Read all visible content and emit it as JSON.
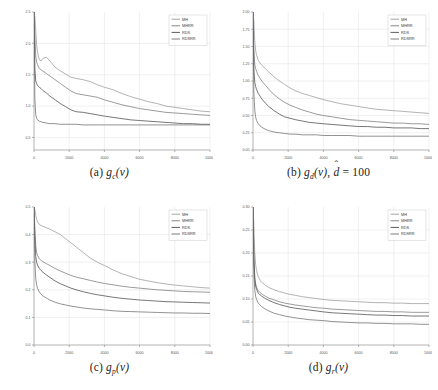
{
  "figure": {
    "panel_count": 4,
    "legend_entries": [
      "MH",
      "MHRR",
      "RDS",
      "RDSRR"
    ],
    "line_colors": [
      "#9a9a9a",
      "#7a7a7a",
      "#4a4a4a",
      "#6e6e6e"
    ],
    "axis_color": "#808080",
    "grid_color": "#d8d8d8",
    "background": "#ffffff"
  },
  "panels": {
    "a": {
      "caption_label": "(a)",
      "caption_func": "g",
      "caption_sub": "c",
      "caption_arg": "(v)",
      "caption_full": "(a) g_c(v)",
      "legend": [
        "MH",
        "MHRR",
        "RDS",
        "RDSRR"
      ],
      "x_ticks": [
        "0",
        "2000",
        "4000",
        "6000",
        "8000",
        "10000"
      ],
      "y_ticks": [
        "0.5",
        "1.0",
        "1.5",
        "2.0",
        "2.5"
      ]
    },
    "b": {
      "caption_label": "(b)",
      "caption_func": "g",
      "caption_sub": "d",
      "caption_arg": "(v),",
      "caption_hat_var": "d",
      "caption_eq": "= 100",
      "caption_full": "(b) g_d(v), d̂ = 100",
      "legend": [
        "MH",
        "MHRR",
        "RDS",
        "RDSRR"
      ],
      "x_ticks": [
        "0",
        "2000",
        "4000",
        "6000",
        "8000",
        "10000"
      ],
      "y_ticks": [
        "0.00",
        "0.25",
        "0.50",
        "0.75",
        "1.00",
        "1.25",
        "1.50",
        "1.75",
        "2.00"
      ]
    },
    "c": {
      "caption_label": "(c)",
      "caption_func": "g",
      "caption_sub": "p",
      "caption_arg": "(v)",
      "caption_full": "(c) g_p(v)",
      "legend": [
        "MH",
        "MHRR",
        "RDS",
        "RDSRR"
      ],
      "x_ticks": [
        "0",
        "2000",
        "4000",
        "6000",
        "8000",
        "10000"
      ],
      "y_ticks": [
        "0.0",
        "0.1",
        "0.2",
        "0.3",
        "0.4",
        "0.5"
      ]
    },
    "d": {
      "caption_label": "(d)",
      "caption_func": "g",
      "caption_sub": "r",
      "caption_arg": "(v)",
      "caption_full": "(d) g_r(v)",
      "legend": [
        "MH",
        "MHRR",
        "RDS",
        "RDSRR"
      ],
      "x_ticks": [
        "0",
        "2000",
        "4000",
        "6000",
        "8000",
        "10000"
      ],
      "y_ticks": [
        "0.00",
        "0.05",
        "0.10",
        "0.15",
        "0.20",
        "0.25",
        "0.30"
      ]
    }
  },
  "chart_data": [
    {
      "type": "line",
      "panel": "a",
      "title": "(a) g_c(v)",
      "xlabel": "",
      "ylabel": "",
      "xlim": [
        0,
        10000
      ],
      "ylim": [
        0.3,
        2.5
      ],
      "grid": true,
      "legend_position": "top-right",
      "x": [
        0,
        50,
        100,
        150,
        200,
        300,
        400,
        500,
        700,
        900,
        1200,
        1500,
        1800,
        2100,
        2400,
        2800,
        3200,
        3600,
        4000,
        4500,
        5000,
        5500,
        6000,
        6500,
        7000,
        7500,
        8000,
        8500,
        9000,
        9500,
        10000
      ],
      "series": [
        {
          "name": "MH",
          "color": "#9a9a9a",
          "values": [
            2.5,
            2.42,
            2.2,
            1.98,
            1.86,
            1.74,
            1.72,
            1.76,
            1.78,
            1.72,
            1.62,
            1.56,
            1.51,
            1.46,
            1.44,
            1.42,
            1.39,
            1.34,
            1.3,
            1.26,
            1.2,
            1.15,
            1.11,
            1.07,
            1.04,
            1.0,
            0.98,
            0.96,
            0.94,
            0.92,
            0.91
          ]
        },
        {
          "name": "MHRR",
          "color": "#7a7a7a",
          "values": [
            2.5,
            2.12,
            1.8,
            1.7,
            1.66,
            1.6,
            1.58,
            1.56,
            1.52,
            1.48,
            1.42,
            1.36,
            1.3,
            1.24,
            1.2,
            1.18,
            1.16,
            1.14,
            1.1,
            1.06,
            1.02,
            0.99,
            0.96,
            0.94,
            0.92,
            0.9,
            0.89,
            0.88,
            0.87,
            0.86,
            0.85
          ]
        },
        {
          "name": "RDS",
          "color": "#4a4a4a",
          "values": [
            2.5,
            1.58,
            1.4,
            1.36,
            1.33,
            1.3,
            1.28,
            1.25,
            1.21,
            1.16,
            1.1,
            1.04,
            0.99,
            0.94,
            0.91,
            0.9,
            0.88,
            0.86,
            0.84,
            0.82,
            0.8,
            0.78,
            0.77,
            0.76,
            0.75,
            0.74,
            0.73,
            0.72,
            0.72,
            0.71,
            0.71
          ]
        },
        {
          "name": "RDSRR",
          "color": "#6e6e6e",
          "values": [
            2.5,
            1.1,
            0.86,
            0.8,
            0.78,
            0.76,
            0.75,
            0.74,
            0.73,
            0.72,
            0.72,
            0.71,
            0.71,
            0.71,
            0.71,
            0.7,
            0.7,
            0.7,
            0.7,
            0.7,
            0.7,
            0.7,
            0.7,
            0.7,
            0.7,
            0.7,
            0.7,
            0.7,
            0.7,
            0.7,
            0.7
          ]
        }
      ]
    },
    {
      "type": "line",
      "panel": "b",
      "title": "(b) g_d(v), d-hat = 100",
      "xlabel": "",
      "ylabel": "",
      "xlim": [
        0,
        10000
      ],
      "ylim": [
        0.0,
        2.0
      ],
      "grid": true,
      "legend_position": "top-right",
      "x": [
        0,
        50,
        100,
        150,
        200,
        300,
        400,
        500,
        700,
        900,
        1200,
        1500,
        1800,
        2100,
        2400,
        2800,
        3200,
        3600,
        4000,
        4500,
        5000,
        5500,
        6000,
        6500,
        7000,
        7500,
        8000,
        8500,
        9000,
        9500,
        10000
      ],
      "series": [
        {
          "name": "MH",
          "color": "#9a9a9a",
          "values": [
            2.0,
            1.86,
            1.58,
            1.44,
            1.38,
            1.3,
            1.26,
            1.23,
            1.18,
            1.13,
            1.06,
            1.0,
            0.95,
            0.9,
            0.86,
            0.82,
            0.79,
            0.76,
            0.73,
            0.7,
            0.67,
            0.65,
            0.63,
            0.61,
            0.59,
            0.58,
            0.57,
            0.56,
            0.55,
            0.54,
            0.53
          ]
        },
        {
          "name": "MHRR",
          "color": "#7a7a7a",
          "values": [
            2.0,
            1.46,
            1.24,
            1.18,
            1.14,
            1.08,
            1.04,
            1.0,
            0.94,
            0.88,
            0.8,
            0.74,
            0.69,
            0.65,
            0.62,
            0.58,
            0.55,
            0.52,
            0.5,
            0.48,
            0.46,
            0.44,
            0.43,
            0.42,
            0.41,
            0.4,
            0.39,
            0.39,
            0.38,
            0.38,
            0.37
          ]
        },
        {
          "name": "RDS",
          "color": "#4a4a4a",
          "values": [
            2.0,
            1.16,
            0.98,
            0.92,
            0.88,
            0.82,
            0.78,
            0.74,
            0.68,
            0.63,
            0.57,
            0.52,
            0.48,
            0.46,
            0.44,
            0.42,
            0.4,
            0.39,
            0.38,
            0.37,
            0.36,
            0.35,
            0.34,
            0.34,
            0.33,
            0.33,
            0.32,
            0.32,
            0.32,
            0.31,
            0.31
          ]
        },
        {
          "name": "RDSRR",
          "color": "#6e6e6e",
          "values": [
            2.0,
            0.82,
            0.58,
            0.48,
            0.43,
            0.38,
            0.35,
            0.33,
            0.3,
            0.28,
            0.26,
            0.25,
            0.24,
            0.23,
            0.23,
            0.22,
            0.22,
            0.22,
            0.21,
            0.21,
            0.21,
            0.21,
            0.2,
            0.2,
            0.2,
            0.2,
            0.2,
            0.2,
            0.2,
            0.2,
            0.2
          ]
        }
      ]
    },
    {
      "type": "line",
      "panel": "c",
      "title": "(c) g_p(v)",
      "xlabel": "",
      "ylabel": "",
      "xlim": [
        0,
        10000
      ],
      "ylim": [
        0.0,
        0.5
      ],
      "grid": true,
      "legend_position": "top-right",
      "x": [
        0,
        50,
        100,
        150,
        200,
        300,
        400,
        500,
        700,
        900,
        1200,
        1500,
        1800,
        2100,
        2400,
        2800,
        3200,
        3600,
        4000,
        4500,
        5000,
        5500,
        6000,
        6500,
        7000,
        7500,
        8000,
        8500,
        9000,
        9500,
        10000
      ],
      "series": [
        {
          "name": "MH",
          "color": "#9a9a9a",
          "values": [
            0.5,
            0.49,
            0.47,
            0.455,
            0.446,
            0.437,
            0.433,
            0.43,
            0.425,
            0.42,
            0.41,
            0.4,
            0.385,
            0.37,
            0.355,
            0.335,
            0.315,
            0.3,
            0.288,
            0.272,
            0.258,
            0.248,
            0.238,
            0.232,
            0.226,
            0.221,
            0.217,
            0.214,
            0.211,
            0.208,
            0.206
          ]
        },
        {
          "name": "MHRR",
          "color": "#7a7a7a",
          "values": [
            0.5,
            0.42,
            0.36,
            0.335,
            0.325,
            0.313,
            0.307,
            0.302,
            0.295,
            0.288,
            0.277,
            0.268,
            0.26,
            0.252,
            0.246,
            0.24,
            0.234,
            0.228,
            0.223,
            0.218,
            0.213,
            0.209,
            0.206,
            0.203,
            0.2,
            0.198,
            0.196,
            0.194,
            0.193,
            0.192,
            0.191
          ]
        },
        {
          "name": "RDS",
          "color": "#4a4a4a",
          "values": [
            0.5,
            0.38,
            0.32,
            0.3,
            0.29,
            0.278,
            0.27,
            0.264,
            0.254,
            0.245,
            0.232,
            0.222,
            0.214,
            0.206,
            0.2,
            0.193,
            0.187,
            0.182,
            0.178,
            0.173,
            0.169,
            0.166,
            0.163,
            0.161,
            0.159,
            0.157,
            0.156,
            0.155,
            0.154,
            0.153,
            0.152
          ]
        },
        {
          "name": "RDSRR",
          "color": "#6e6e6e",
          "values": [
            0.5,
            0.3,
            0.24,
            0.218,
            0.206,
            0.192,
            0.184,
            0.178,
            0.17,
            0.163,
            0.155,
            0.149,
            0.145,
            0.141,
            0.138,
            0.134,
            0.131,
            0.129,
            0.127,
            0.124,
            0.122,
            0.121,
            0.12,
            0.119,
            0.118,
            0.117,
            0.116,
            0.116,
            0.115,
            0.115,
            0.114
          ]
        }
      ]
    },
    {
      "type": "line",
      "panel": "d",
      "title": "(d) g_r(v)",
      "xlabel": "",
      "ylabel": "",
      "xlim": [
        0,
        10000
      ],
      "ylim": [
        0.0,
        0.3
      ],
      "grid": true,
      "legend_position": "top-right",
      "x": [
        0,
        50,
        100,
        150,
        200,
        300,
        400,
        500,
        700,
        900,
        1200,
        1500,
        1800,
        2100,
        2400,
        2800,
        3200,
        3600,
        4000,
        4500,
        5000,
        5500,
        6000,
        6500,
        7000,
        7500,
        8000,
        8500,
        9000,
        9500,
        10000
      ],
      "series": [
        {
          "name": "MH",
          "color": "#9a9a9a",
          "values": [
            0.3,
            0.26,
            0.2,
            0.175,
            0.162,
            0.148,
            0.141,
            0.136,
            0.13,
            0.125,
            0.12,
            0.116,
            0.113,
            0.11,
            0.108,
            0.105,
            0.103,
            0.101,
            0.099,
            0.097,
            0.096,
            0.095,
            0.094,
            0.093,
            0.092,
            0.092,
            0.091,
            0.091,
            0.09,
            0.09,
            0.09
          ]
        },
        {
          "name": "MHRR",
          "color": "#7a7a7a",
          "values": [
            0.3,
            0.19,
            0.148,
            0.133,
            0.126,
            0.118,
            0.114,
            0.111,
            0.106,
            0.102,
            0.098,
            0.094,
            0.091,
            0.089,
            0.087,
            0.085,
            0.083,
            0.081,
            0.08,
            0.078,
            0.077,
            0.076,
            0.075,
            0.074,
            0.073,
            0.073,
            0.072,
            0.072,
            0.071,
            0.071,
            0.071
          ]
        },
        {
          "name": "RDS",
          "color": "#4a4a4a",
          "values": [
            0.3,
            0.185,
            0.142,
            0.128,
            0.121,
            0.113,
            0.109,
            0.106,
            0.101,
            0.097,
            0.092,
            0.088,
            0.085,
            0.082,
            0.08,
            0.078,
            0.076,
            0.074,
            0.072,
            0.07,
            0.069,
            0.068,
            0.067,
            0.066,
            0.065,
            0.065,
            0.064,
            0.064,
            0.063,
            0.063,
            0.063
          ]
        },
        {
          "name": "RDSRR",
          "color": "#6e6e6e",
          "values": [
            0.3,
            0.16,
            0.12,
            0.106,
            0.099,
            0.091,
            0.087,
            0.083,
            0.078,
            0.074,
            0.069,
            0.066,
            0.063,
            0.061,
            0.059,
            0.057,
            0.055,
            0.054,
            0.053,
            0.051,
            0.05,
            0.049,
            0.048,
            0.048,
            0.047,
            0.047,
            0.046,
            0.046,
            0.046,
            0.045,
            0.045
          ]
        }
      ]
    }
  ]
}
